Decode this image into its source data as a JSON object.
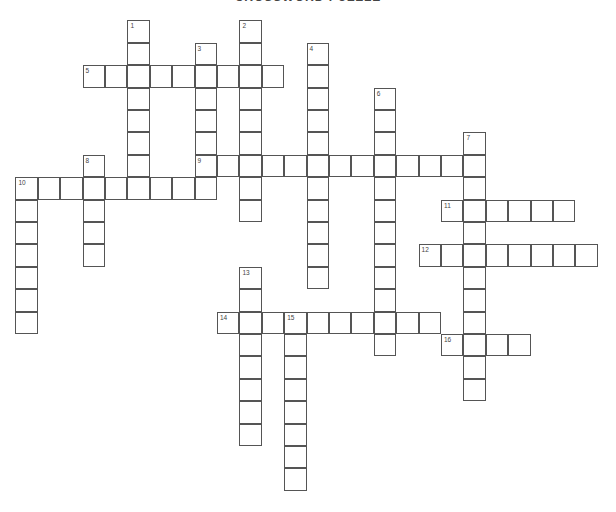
{
  "title": "CROSSWORD PUZZLE",
  "grid": {
    "origin_x": 16,
    "origin_y": 21,
    "cell_size": 22.4,
    "border_color": "#555555"
  },
  "entries": [
    {
      "number": "1",
      "direction": "down",
      "row": 0,
      "col": 5,
      "length": 8
    },
    {
      "number": "2",
      "direction": "down",
      "row": 0,
      "col": 10,
      "length": 9
    },
    {
      "number": "3",
      "direction": "down",
      "row": 1,
      "col": 8,
      "length": 7
    },
    {
      "number": "4",
      "direction": "down",
      "row": 1,
      "col": 13,
      "length": 11
    },
    {
      "number": "5",
      "direction": "across",
      "row": 2,
      "col": 3,
      "length": 9
    },
    {
      "number": "6",
      "direction": "down",
      "row": 3,
      "col": 16,
      "length": 12
    },
    {
      "number": "7",
      "direction": "down",
      "row": 5,
      "col": 20,
      "length": 12
    },
    {
      "number": "8",
      "direction": "down",
      "row": 6,
      "col": 3,
      "length": 5
    },
    {
      "number": "9",
      "direction": "across",
      "row": 6,
      "col": 8,
      "length": 13
    },
    {
      "number": "10",
      "direction": "across",
      "row": 7,
      "col": 0,
      "length": 9
    },
    {
      "number": "10",
      "direction": "down",
      "row": 7,
      "col": 0,
      "length": 7
    },
    {
      "number": "11",
      "direction": "across",
      "row": 8,
      "col": 19,
      "length": 6
    },
    {
      "number": "12",
      "direction": "across",
      "row": 10,
      "col": 18,
      "length": 8
    },
    {
      "number": "13",
      "direction": "down",
      "row": 11,
      "col": 10,
      "length": 8
    },
    {
      "number": "14",
      "direction": "across",
      "row": 13,
      "col": 9,
      "length": 10
    },
    {
      "number": "15",
      "direction": "down",
      "row": 13,
      "col": 12,
      "length": 8
    },
    {
      "number": "16",
      "direction": "across",
      "row": 14,
      "col": 19,
      "length": 4
    }
  ]
}
